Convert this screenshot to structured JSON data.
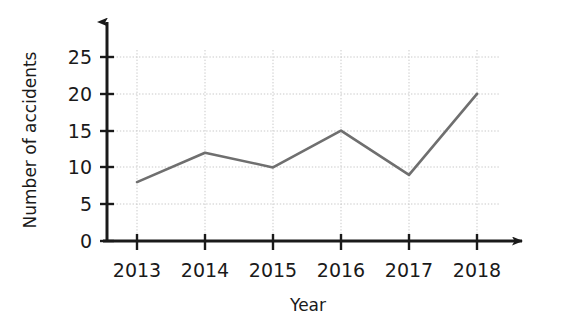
{
  "chart_data": {
    "type": "line",
    "title": "",
    "xlabel": "Year",
    "ylabel": "Number of accidents",
    "categories": [
      "2013",
      "2014",
      "2015",
      "2016",
      "2017",
      "2018"
    ],
    "values": [
      8,
      12,
      10,
      15,
      9,
      20
    ],
    "series": [
      {
        "name": "Number of accidents",
        "values": [
          8,
          12,
          10,
          15,
          9,
          20
        ]
      }
    ],
    "x_tick_labels": [
      "2013",
      "2014",
      "2015",
      "2016",
      "2017",
      "2018"
    ],
    "y_tick_labels": [
      "0",
      "5",
      "10",
      "15",
      "20",
      "25"
    ],
    "y_tick_values": [
      0,
      5,
      10,
      15,
      20,
      25
    ],
    "ylim": [
      0,
      27
    ],
    "grid": true,
    "grid_style": "dotted",
    "legend": "none",
    "colors": {
      "line": "#6f6f6f",
      "axis": "#1a1a1a",
      "grid": "#c9c9c9",
      "background": "#ffffff",
      "text": "#1a1a1a"
    }
  }
}
